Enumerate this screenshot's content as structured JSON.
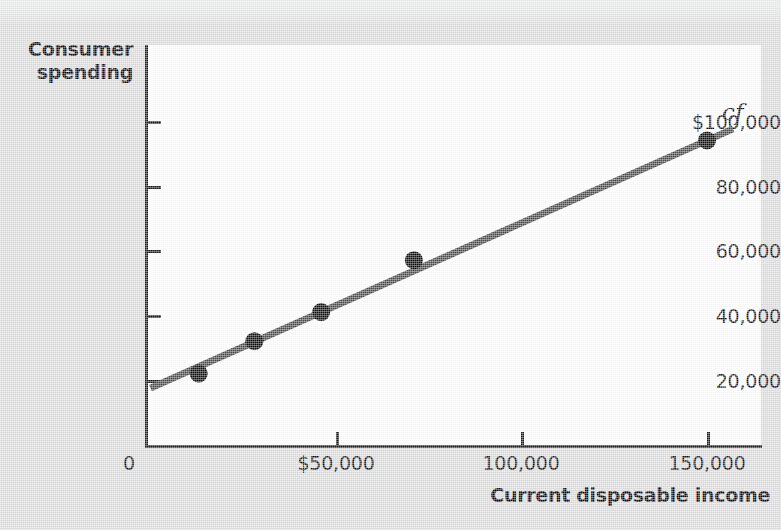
{
  "chart_data": {
    "type": "scatter",
    "title": "",
    "xlabel": "Current disposable income",
    "ylabel": "Consumer spending",
    "series_label": "cf",
    "xlim": [
      0,
      162000
    ],
    "ylim": [
      0,
      110000
    ],
    "grid": false,
    "legend_position": "inline-right",
    "x_ticks": [
      {
        "value": 50000,
        "label": "$50,000"
      },
      {
        "value": 100000,
        "label": "100,000"
      },
      {
        "value": 150000,
        "label": "150,000"
      }
    ],
    "y_ticks": [
      {
        "value": 100000,
        "label": "$100,000"
      },
      {
        "value": 80000,
        "label": "80,000"
      },
      {
        "value": 60000,
        "label": "60,000"
      },
      {
        "value": 40000,
        "label": "40,000"
      },
      {
        "value": 20000,
        "label": "20,000"
      }
    ],
    "origin_label": "0",
    "points": [
      {
        "x": 13000,
        "y": 22000
      },
      {
        "x": 28000,
        "y": 32000
      },
      {
        "x": 46000,
        "y": 41000
      },
      {
        "x": 71000,
        "y": 57000
      },
      {
        "x": 150000,
        "y": 94000
      }
    ],
    "fit_line": {
      "label": "cf",
      "intercept": 17500,
      "slope": 0.51,
      "x_start": 0,
      "x_end": 157000
    },
    "colors": {
      "line": "#4d4d4d",
      "point": "#0f0f0f",
      "axis": "#1c1c1c",
      "plot_background": "#ffffff",
      "figure_background": "#dedede",
      "text": "#121212"
    }
  }
}
